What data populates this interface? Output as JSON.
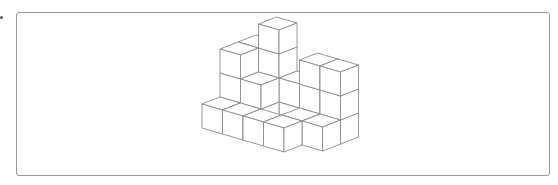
{
  "figure": {
    "frame": {
      "x": 16,
      "y": 12,
      "width": 534,
      "height": 164,
      "border_color": "#9a9a9a"
    },
    "line_color": "#8a8a8a",
    "origin": [
      202,
      128
    ],
    "vec_x": [
      20.5,
      6
    ],
    "vec_y": [
      18,
      -7
    ],
    "height": 24,
    "cubes": [
      {
        "x": 0,
        "y": 0,
        "z": 0
      },
      {
        "x": 1,
        "y": 0,
        "z": 0
      },
      {
        "x": 2,
        "y": 0,
        "z": 0
      },
      {
        "x": 3,
        "y": 0,
        "z": 0
      },
      {
        "x": 0,
        "y": 1,
        "z": 0
      },
      {
        "x": 0,
        "y": 1,
        "z": 1
      },
      {
        "x": 0,
        "y": 1,
        "z": 2
      },
      {
        "x": 1,
        "y": 1,
        "z": 0
      },
      {
        "x": 1,
        "y": 1,
        "z": 1
      },
      {
        "x": 0,
        "y": 2,
        "z": 0
      },
      {
        "x": 0,
        "y": 2,
        "z": 1
      },
      {
        "x": 0,
        "y": 2,
        "z": 2
      },
      {
        "x": 1,
        "y": 2,
        "z": 0
      },
      {
        "x": 1,
        "y": 2,
        "z": 1
      },
      {
        "x": 1,
        "y": 2,
        "z": 2
      },
      {
        "x": 1,
        "y": 2,
        "z": 3
      },
      {
        "x": 2,
        "y": 2,
        "z": 0
      },
      {
        "x": 2,
        "y": 2,
        "z": 1
      },
      {
        "x": 3,
        "y": 1,
        "z": 0
      },
      {
        "x": 3,
        "y": 2,
        "z": 0
      },
      {
        "x": 3,
        "y": 2,
        "z": 1
      },
      {
        "x": 3,
        "y": 2,
        "z": 2
      },
      {
        "x": 4,
        "y": 2,
        "z": 0
      },
      {
        "x": 4,
        "y": 2,
        "z": 1
      },
      {
        "x": 4,
        "y": 2,
        "z": 2
      },
      {
        "x": 4,
        "y": 1,
        "z": 0
      }
    ]
  }
}
